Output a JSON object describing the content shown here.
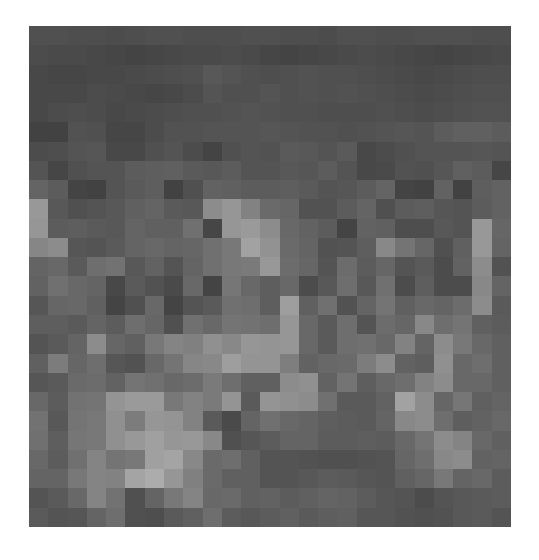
{
  "image": {
    "description": "Pixelated grayscale mosaic image",
    "cols": 25,
    "rows": 26,
    "pixels": [
      [
        80,
        80,
        78,
        78,
        76,
        78,
        80,
        80,
        78,
        78,
        78,
        80,
        80,
        78,
        78,
        76,
        80,
        80,
        78,
        78,
        80,
        80,
        80,
        78,
        78
      ],
      [
        76,
        74,
        74,
        72,
        70,
        68,
        70,
        72,
        74,
        74,
        76,
        74,
        70,
        68,
        70,
        72,
        74,
        76,
        74,
        72,
        70,
        68,
        70,
        72,
        74
      ],
      [
        72,
        70,
        70,
        72,
        72,
        74,
        76,
        78,
        80,
        88,
        84,
        80,
        78,
        80,
        82,
        80,
        80,
        78,
        76,
        74,
        72,
        74,
        76,
        78,
        78
      ],
      [
        72,
        72,
        72,
        76,
        74,
        72,
        70,
        72,
        76,
        84,
        80,
        80,
        84,
        80,
        82,
        80,
        82,
        80,
        78,
        76,
        74,
        76,
        78,
        80,
        80
      ],
      [
        72,
        76,
        78,
        76,
        72,
        74,
        76,
        78,
        80,
        80,
        82,
        84,
        82,
        80,
        80,
        78,
        78,
        78,
        80,
        78,
        76,
        78,
        80,
        82,
        82
      ],
      [
        66,
        66,
        82,
        80,
        70,
        70,
        76,
        82,
        82,
        84,
        84,
        84,
        86,
        84,
        82,
        82,
        80,
        82,
        84,
        86,
        84,
        92,
        96,
        96,
        92
      ],
      [
        76,
        78,
        84,
        86,
        72,
        72,
        80,
        84,
        76,
        68,
        80,
        84,
        82,
        90,
        88,
        84,
        90,
        72,
        76,
        80,
        84,
        84,
        84,
        86,
        84
      ],
      [
        84,
        70,
        80,
        84,
        84,
        92,
        94,
        96,
        90,
        88,
        92,
        84,
        84,
        88,
        86,
        92,
        84,
        72,
        74,
        82,
        80,
        86,
        96,
        92,
        70
      ],
      [
        100,
        92,
        68,
        66,
        84,
        90,
        94,
        66,
        80,
        98,
        96,
        92,
        92,
        94,
        90,
        84,
        86,
        92,
        100,
        68,
        66,
        98,
        66,
        94,
        98
      ],
      [
        152,
        88,
        80,
        84,
        88,
        96,
        100,
        90,
        88,
        140,
        150,
        130,
        106,
        102,
        82,
        82,
        92,
        100,
        80,
        92,
        94,
        86,
        84,
        92,
        98
      ],
      [
        150,
        92,
        94,
        90,
        88,
        100,
        96,
        96,
        112,
        70,
        150,
        154,
        140,
        104,
        98,
        92,
        68,
        98,
        96,
        78,
        78,
        88,
        84,
        152,
        102
      ],
      [
        134,
        140,
        86,
        84,
        90,
        100,
        104,
        100,
        102,
        112,
        120,
        162,
        146,
        106,
        100,
        82,
        84,
        94,
        136,
        116,
        102,
        80,
        96,
        152,
        100
      ],
      [
        100,
        104,
        90,
        110,
        114,
        88,
        98,
        84,
        100,
        112,
        120,
        122,
        152,
        108,
        102,
        84,
        108,
        92,
        102,
        84,
        90,
        76,
        98,
        140,
        82
      ],
      [
        98,
        112,
        104,
        100,
        72,
        90,
        82,
        74,
        104,
        68,
        118,
        104,
        94,
        104,
        76,
        88,
        110,
        88,
        112,
        76,
        94,
        76,
        76,
        136,
        100
      ],
      [
        86,
        102,
        104,
        96,
        68,
        80,
        104,
        68,
        84,
        90,
        112,
        110,
        94,
        158,
        96,
        112,
        82,
        100,
        116,
        96,
        104,
        100,
        108,
        140,
        90
      ],
      [
        94,
        94,
        90,
        100,
        92,
        110,
        102,
        80,
        112,
        104,
        116,
        114,
        110,
        150,
        104,
        90,
        110,
        84,
        108,
        102,
        136,
        110,
        116,
        96,
        92
      ],
      [
        84,
        90,
        100,
        140,
        102,
        96,
        120,
        132,
        128,
        144,
        136,
        150,
        148,
        150,
        104,
        90,
        110,
        112,
        104,
        130,
        100,
        140,
        120,
        104,
        96
      ],
      [
        96,
        124,
        102,
        110,
        86,
        82,
        104,
        116,
        134,
        136,
        158,
        148,
        148,
        126,
        98,
        104,
        106,
        124,
        140,
        98,
        94,
        144,
        104,
        110,
        96
      ],
      [
        86,
        90,
        106,
        108,
        98,
        116,
        112,
        104,
        108,
        122,
        110,
        96,
        96,
        140,
        144,
        98,
        116,
        94,
        104,
        110,
        130,
        140,
        104,
        104,
        96
      ],
      [
        104,
        92,
        114,
        116,
        148,
        154,
        154,
        120,
        130,
        122,
        148,
        90,
        148,
        144,
        140,
        112,
        90,
        90,
        98,
        162,
        140,
        102,
        118,
        96,
        100
      ],
      [
        114,
        88,
        116,
        120,
        144,
        124,
        150,
        148,
        130,
        90,
        74,
        100,
        112,
        104,
        100,
        94,
        92,
        90,
        100,
        136,
        140,
        110,
        94,
        98,
        104
      ],
      [
        112,
        94,
        118,
        120,
        144,
        152,
        160,
        150,
        152,
        136,
        80,
        86,
        92,
        100,
        100,
        92,
        92,
        94,
        92,
        104,
        116,
        140,
        132,
        104,
        96
      ],
      [
        104,
        92,
        112,
        132,
        116,
        120,
        160,
        164,
        136,
        106,
        110,
        96,
        84,
        84,
        82,
        80,
        80,
        82,
        84,
        102,
        110,
        136,
        140,
        98,
        100
      ],
      [
        100,
        100,
        120,
        132,
        130,
        164,
        172,
        150,
        128,
        106,
        96,
        96,
        84,
        84,
        88,
        92,
        90,
        86,
        84,
        96,
        102,
        120,
        100,
        104,
        92
      ],
      [
        84,
        90,
        104,
        132,
        114,
        80,
        100,
        120,
        132,
        104,
        106,
        96,
        98,
        92,
        96,
        100,
        98,
        92,
        86,
        84,
        76,
        84,
        88,
        90,
        92
      ],
      [
        90,
        84,
        86,
        100,
        110,
        80,
        78,
        90,
        96,
        110,
        92,
        88,
        92,
        96,
        90,
        94,
        96,
        86,
        86,
        82,
        80,
        82,
        88,
        90,
        84
      ]
    ]
  }
}
